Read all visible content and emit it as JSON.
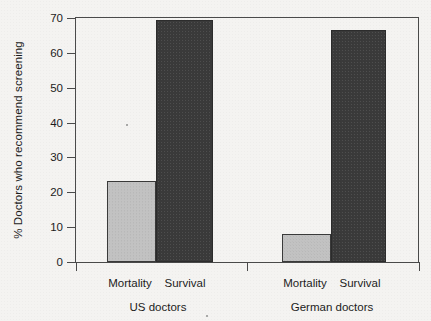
{
  "chart_data": {
    "type": "bar",
    "title": "",
    "subtitle": "",
    "xlabel": "",
    "ylabel": "% Doctors who recommend screening",
    "ylim": [
      0,
      70
    ],
    "yticks": [
      0,
      10,
      20,
      30,
      40,
      50,
      60,
      70
    ],
    "ytick_labels": [
      "0",
      "10",
      "20",
      "30",
      "40",
      "50",
      "60",
      "70"
    ],
    "grid": false,
    "legend": "none",
    "groups": [
      "US doctors",
      "German doctors"
    ],
    "categories": [
      "Mortality",
      "Survival"
    ],
    "series": [
      {
        "name": "Mortality",
        "values": [
          23,
          8
        ],
        "color": "#c2c2c2"
      },
      {
        "name": "Survival",
        "values": [
          69,
          66
        ],
        "color": "#3a3a3a"
      }
    ],
    "bars": [
      {
        "group": "US doctors",
        "category": "Mortality",
        "value": 23,
        "color": "#c2c2c2"
      },
      {
        "group": "US doctors",
        "category": "Survival",
        "value": 69,
        "color": "#3a3a3a"
      },
      {
        "group": "German doctors",
        "category": "Mortality",
        "value": 8,
        "color": "#c2c2c2"
      },
      {
        "group": "German doctors",
        "category": "Survival",
        "value": 66,
        "color": "#3a3a3a"
      }
    ]
  },
  "axis": {
    "y_title": "% Doctors who recommend screening",
    "tick_0": "0",
    "tick_10": "10",
    "tick_20": "20",
    "tick_30": "30",
    "tick_40": "40",
    "tick_50": "50",
    "tick_60": "60",
    "tick_70": "70"
  },
  "xaxis": {
    "us_mortality": "Mortality",
    "us_survival": "Survival",
    "de_mortality": "Mortality",
    "de_survival": "Survival",
    "group_us": "US doctors",
    "group_german": "German doctors"
  },
  "colors": {
    "background": "#f4f3f1",
    "axis": "#4a4a4a",
    "text": "#1c1c1c",
    "mortality_bar": "#c2c2c2",
    "survival_bar": "#3a3a3a"
  }
}
